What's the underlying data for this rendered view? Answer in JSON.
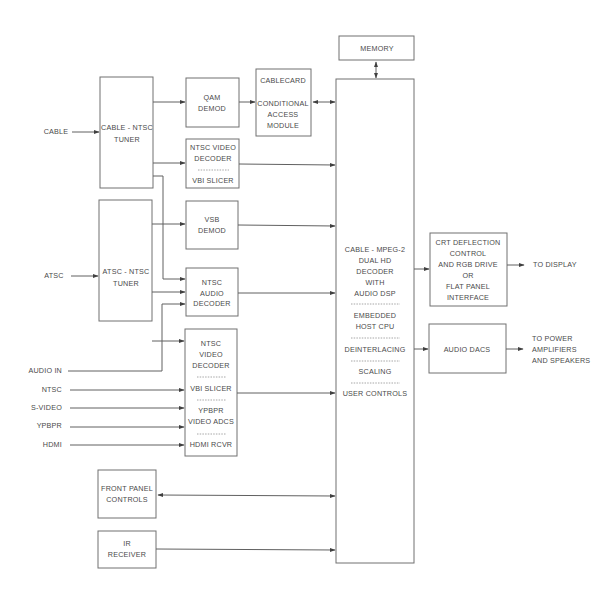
{
  "diagram": {
    "inputs": {
      "cable": "CABLE",
      "atsc": "ATSC",
      "audio_in": "AUDIO IN",
      "ntsc": "NTSC",
      "s_video": "S-VIDEO",
      "ypbpr": "YPBPR",
      "hdmi": "HDMI"
    },
    "blocks": {
      "cable_tuner": [
        "CABLE - NTSC",
        "TUNER"
      ],
      "atsc_tuner": [
        "ATSC - NTSC",
        "TUNER"
      ],
      "qam_demod": [
        "QAM",
        "DEMOD"
      ],
      "cablecard": [
        "CABLECARD",
        "",
        "CONDITIONAL",
        "ACCESS",
        "MODULE"
      ],
      "ntsc_video_decoder_1": {
        "top": [
          "NTSC VIDEO",
          "DECODER"
        ],
        "bottom": [
          "VBI SLICER"
        ]
      },
      "vsb_demod": [
        "VSB",
        "DEMOD"
      ],
      "ntsc_audio_decoder": [
        "NTSC",
        "AUDIO",
        "DECODER"
      ],
      "ntsc_video_decoder_2": {
        "sections": [
          [
            "NTSC",
            "VIDEO",
            "DECODER"
          ],
          [
            "VBI SLICER"
          ],
          [
            "YPBPR",
            "VIDEO ADCS"
          ],
          [
            "HDMI RCVR"
          ]
        ]
      },
      "memory": [
        "MEMORY"
      ],
      "main_decoder": {
        "sections": [
          [
            "CABLE - MPEG-2",
            "DUAL HD",
            "DECODER",
            "WITH",
            "AUDIO DSP"
          ],
          [
            "EMBEDDED",
            "HOST CPU"
          ],
          [
            "DEINTERLACING"
          ],
          [
            "SCALING"
          ],
          [
            "USER CONTROLS"
          ]
        ]
      },
      "crt_deflection": [
        "CRT DEFLECTION",
        "CONTROL",
        "AND RGB DRIVE",
        "OR",
        "FLAT PANEL",
        "INTERFACE"
      ],
      "audio_dacs": [
        "AUDIO DACS"
      ],
      "front_panel": [
        "FRONT PANEL",
        "CONTROLS"
      ],
      "ir_receiver": [
        "IR",
        "RECEIVER"
      ]
    },
    "outputs": {
      "to_display": "TO DISPLAY",
      "to_power": [
        "TO POWER",
        "AMPLIFIERS",
        "AND SPEAKERS"
      ]
    },
    "colors": {
      "line": "#606060",
      "box_stroke": "#707070",
      "text": "#4a4a4a",
      "background": "#ffffff"
    }
  }
}
